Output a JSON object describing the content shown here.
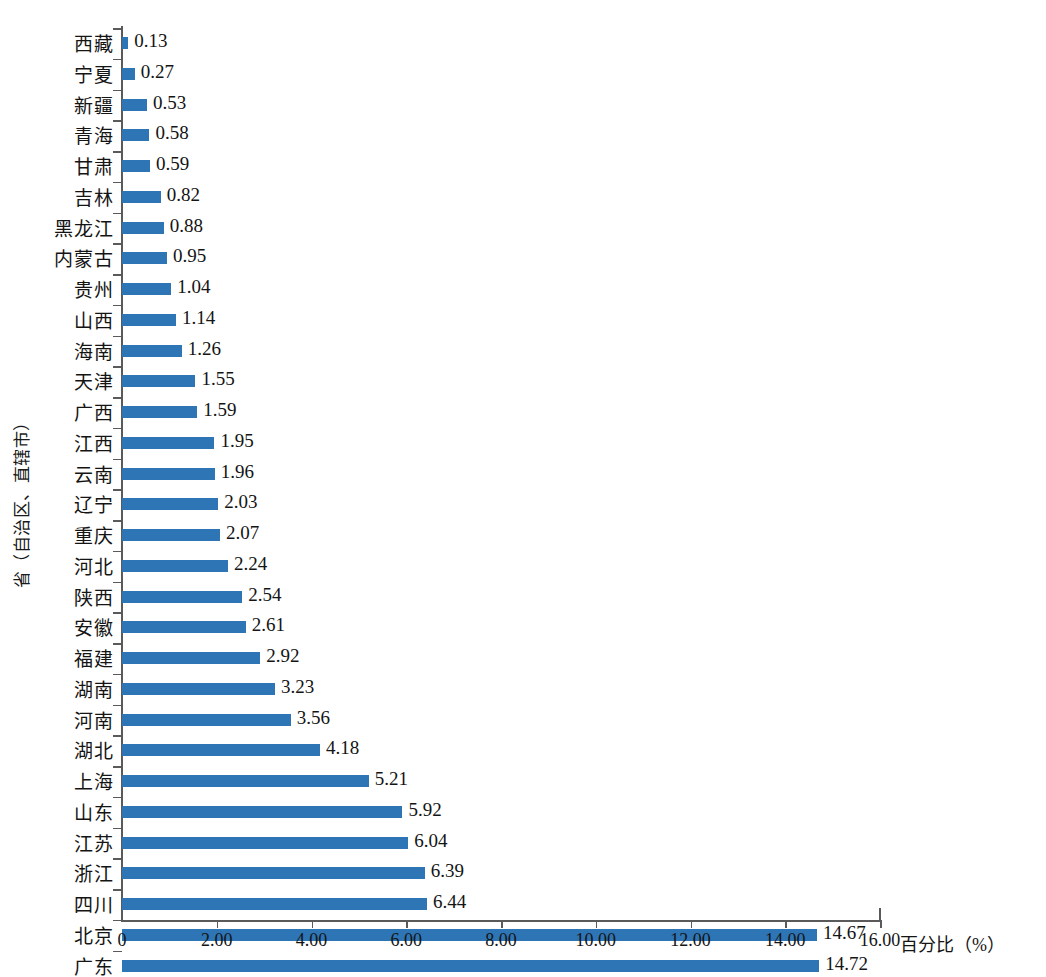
{
  "chart_data": {
    "type": "bar",
    "orientation": "horizontal",
    "title": "",
    "xlabel": "百分比（%）",
    "ylabel": "省（自治区、直辖市）",
    "xlim": [
      0,
      16
    ],
    "xtick_values": [
      0,
      2,
      4,
      6,
      8,
      10,
      12,
      14,
      16
    ],
    "xtick_labels": [
      "0",
      "2.00",
      "4.00",
      "6.00",
      "8.00",
      "10.00",
      "12.00",
      "14.00",
      "16.00"
    ],
    "grid": false,
    "legend": null,
    "bar_color": "#2e75b6",
    "axis_color": "#5a5a5a",
    "categories": [
      "西藏",
      "宁夏",
      "新疆",
      "青海",
      "甘肃",
      "吉林",
      "黑龙江",
      "内蒙古",
      "贵州",
      "山西",
      "海南",
      "天津",
      "广西",
      "江西",
      "云南",
      "辽宁",
      "重庆",
      "河北",
      "陕西",
      "安徽",
      "福建",
      "湖南",
      "河南",
      "湖北",
      "上海",
      "山东",
      "江苏",
      "浙江",
      "四川",
      "北京",
      "广东"
    ],
    "values": [
      0.13,
      0.27,
      0.53,
      0.58,
      0.59,
      0.82,
      0.88,
      0.95,
      1.04,
      1.14,
      1.26,
      1.55,
      1.59,
      1.95,
      1.96,
      2.03,
      2.07,
      2.24,
      2.54,
      2.61,
      2.92,
      3.23,
      3.56,
      4.18,
      5.21,
      5.92,
      6.04,
      6.39,
      6.44,
      14.67,
      14.72
    ],
    "value_labels": [
      "0.13",
      "0.27",
      "0.53",
      "0.58",
      "0.59",
      "0.82",
      "0.88",
      "0.95",
      "1.04",
      "1.14",
      "1.26",
      "1.55",
      "1.59",
      "1.95",
      "1.96",
      "2.03",
      "2.07",
      "2.24",
      "2.54",
      "2.61",
      "2.92",
      "3.23",
      "3.56",
      "4.18",
      "5.21",
      "5.92",
      "6.04",
      "6.39",
      "6.44",
      "14.67",
      "14.72"
    ]
  }
}
